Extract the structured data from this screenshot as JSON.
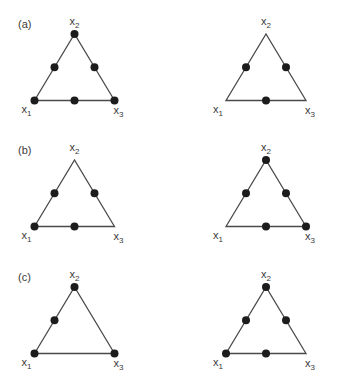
{
  "figure": {
    "panels": [
      {
        "label": "(a)",
        "designs": [
          {
            "vertices": [
              "x1",
              "x2",
              "x3"
            ],
            "points": [
              "x1",
              "x2",
              "x3",
              "x1x2",
              "x2x3",
              "x1x3"
            ]
          },
          {
            "vertices": [
              "x1",
              "x2",
              "x3"
            ],
            "points": [
              "x1x2",
              "x2x3",
              "x1x3"
            ]
          }
        ]
      },
      {
        "label": "(b)",
        "designs": [
          {
            "vertices": [
              "x1",
              "x2",
              "x3"
            ],
            "points": [
              "x1",
              "x1x2",
              "x2x3",
              "x1x3"
            ]
          },
          {
            "vertices": [
              "x1",
              "x2",
              "x3"
            ],
            "points": [
              "x2",
              "x3",
              "x1x2",
              "x2x3",
              "x1x3"
            ]
          }
        ]
      },
      {
        "label": "(c)",
        "designs": [
          {
            "vertices": [
              "x1",
              "x2",
              "x3"
            ],
            "points": [
              "x1",
              "x2",
              "x3",
              "x1x2"
            ]
          },
          {
            "vertices": [
              "x1",
              "x2",
              "x3"
            ],
            "points": [
              "x1",
              "x2",
              "x1x2",
              "x2x3",
              "x1x3"
            ]
          }
        ]
      }
    ],
    "vertex_labels": {
      "x1": {
        "base": "x",
        "sub": "1"
      },
      "x2": {
        "base": "x",
        "sub": "2"
      },
      "x3": {
        "base": "x",
        "sub": "3"
      }
    }
  }
}
